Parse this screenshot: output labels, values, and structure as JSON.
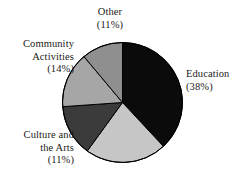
{
  "chart_data": {
    "type": "pie",
    "title": "",
    "subtitle": "",
    "xlabel": "",
    "ylabel": "",
    "legend_position": "outside-labels",
    "grid": false,
    "start_angle_deg": 0,
    "direction": "clockwise",
    "categories": [
      "Education",
      "Culture and the Arts",
      "Community Activities",
      "Other"
    ],
    "values": [
      38,
      11,
      14,
      11
    ],
    "unit": "%",
    "colors": [
      "#0b0b0b",
      "#c6c6c6",
      "#a6a6a6",
      "#8f8f8f"
    ],
    "slices": [
      {
        "name": "Education",
        "value": 38,
        "percent_label": "(38%)",
        "color": "#0b0b0b",
        "label_position": "right",
        "start_deg": 0,
        "end_deg": 137
      },
      {
        "name": "Culture and the Arts",
        "value": 11,
        "percent_label": "(11%)",
        "color": "#c6c6c6",
        "label_position": "bottom-left",
        "start_deg": 137,
        "end_deg": 216
      },
      {
        "name": "Community Activities",
        "value": 14,
        "percent_label": "(14%)",
        "color": "#3b3b3b",
        "label_position": "left",
        "start_deg": 216,
        "end_deg": 266
      },
      {
        "name": "Community Activities",
        "value": 14,
        "percent_label": "(14%)",
        "color": "#a6a6a6",
        "label_position": "left",
        "start_deg": 266,
        "end_deg": 320
      },
      {
        "name": "Other",
        "value": 11,
        "percent_label": "(11%)",
        "color": "#8f8f8f",
        "label_position": "top",
        "start_deg": 320,
        "end_deg": 360
      }
    ],
    "outline_color": "#000000"
  },
  "labels": {
    "other": {
      "name": "Other",
      "percent": "(11%)"
    },
    "community": {
      "line1": "Community",
      "line2": "Activities",
      "percent": "(14%)"
    },
    "culture": {
      "line1": "Culture and",
      "line2": "the Arts",
      "percent": "(11%)"
    },
    "education": {
      "name": "Education",
      "percent": "(38%)"
    }
  }
}
